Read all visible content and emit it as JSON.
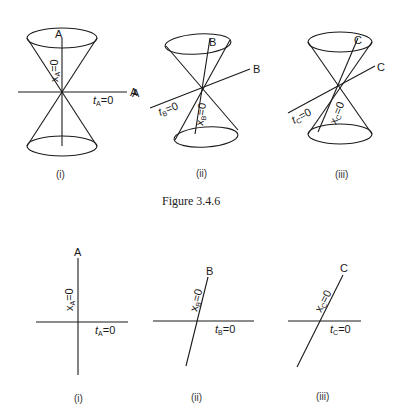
{
  "figure": {
    "caption": "Figure 3.4.6",
    "top_row": [
      {
        "id": "i",
        "label": "(i)",
        "worldline_label": "A",
        "axis_label": "A",
        "x_label_var": "x",
        "x_label_sub": "A",
        "x_label_eq": "=0",
        "t_label_var": "t",
        "t_label_sub": "A",
        "t_label_eq": "=0"
      },
      {
        "id": "ii",
        "label": "(ii)",
        "worldline_label": "B",
        "axis_label": "B",
        "left_label": "A",
        "x_label_var": "x",
        "x_label_sub": "B",
        "x_label_eq": "=0",
        "t_label_var": "t",
        "t_label_sub": "B",
        "t_label_eq": "=0"
      },
      {
        "id": "iii",
        "label": "(iii)",
        "worldline_label": "C",
        "axis_label": "C",
        "x_label_var": "x",
        "x_label_sub": "C",
        "x_label_eq": "=0",
        "t_label_var": "t",
        "t_label_sub": "C",
        "t_label_eq": "=0"
      }
    ],
    "bottom_row": [
      {
        "id": "i",
        "label": "(i)",
        "worldline_label": "A",
        "x_label_var": "x",
        "x_label_sub": "A",
        "x_label_eq": "=0",
        "t_label_var": "t",
        "t_label_sub": "A",
        "t_label_eq": "=0"
      },
      {
        "id": "ii",
        "label": "(ii)",
        "worldline_label": "B",
        "x_label_var": "x",
        "x_label_sub": "B",
        "x_label_eq": "=0",
        "t_label_var": "t",
        "t_label_sub": "B",
        "t_label_eq": "=0"
      },
      {
        "id": "iii",
        "label": "(iii)",
        "worldline_label": "C",
        "x_label_var": "x",
        "x_label_sub": "C",
        "x_label_eq": "=0",
        "t_label_var": "t",
        "t_label_sub": "C",
        "t_label_eq": "=0"
      }
    ]
  }
}
